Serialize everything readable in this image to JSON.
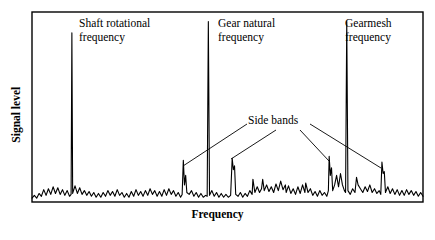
{
  "figure": {
    "type": "vibration-spectrum",
    "background": "#ffffff",
    "ink_color": "#000000"
  },
  "axes": {
    "x_label": "Frequency",
    "y_label": "Signal level",
    "frame": {
      "left": 32,
      "top": 12,
      "right": 423,
      "bottom": 202
    },
    "x_ticks": [],
    "y_ticks": [],
    "grid": false
  },
  "annotations": [
    {
      "id": "shaft-rotational-frequency",
      "text": "Shaft rotational\nfrequency",
      "x": 79,
      "y": 17
    },
    {
      "id": "gear-natural-frequency",
      "text": "Gear natural\nfrequency",
      "x": 218,
      "y": 17
    },
    {
      "id": "gearmesh-frequency",
      "text": "Gearmesh\nfrequency",
      "x": 345,
      "y": 17
    },
    {
      "id": "side-bands",
      "text": "Side bands",
      "x": 248,
      "y": 114
    }
  ],
  "leader_lines": [
    {
      "id": "sideband-leader-left",
      "x1": 247,
      "y1": 124,
      "x2": 183,
      "y2": 166
    },
    {
      "id": "sideband-leader-inner-left",
      "x1": 276,
      "y1": 130,
      "x2": 231,
      "y2": 159
    },
    {
      "id": "sideband-leader-inner-right",
      "x1": 300,
      "y1": 130,
      "x2": 329,
      "y2": 161
    },
    {
      "id": "sideband-leader-right",
      "x1": 310,
      "y1": 124,
      "x2": 381,
      "y2": 168
    }
  ],
  "chart_data": {
    "type": "line",
    "title": "",
    "xlabel": "Frequency",
    "ylabel": "Signal level",
    "xlim": [
      0,
      100
    ],
    "ylim": [
      0,
      100
    ],
    "grid": false,
    "legend": null,
    "series": [
      {
        "name": "vibration spectrum",
        "color": "#000000",
        "description": "Broadband noise floor with three dominant narrow peaks and sideband clusters",
        "peaks": [
          {
            "label": "Shaft rotational frequency",
            "x": 10.2,
            "height": 89
          },
          {
            "label": "Gear natural frequency",
            "x": 45.1,
            "height": 95
          },
          {
            "label": "Gearmesh frequency",
            "x": 80.5,
            "height": 95
          }
        ],
        "sidebands": [
          {
            "x": 38.7,
            "height": 22
          },
          {
            "x": 51.2,
            "height": 23
          },
          {
            "x": 56.5,
            "height": 12
          },
          {
            "x": 59.0,
            "height": 12
          },
          {
            "x": 65.0,
            "height": 5
          },
          {
            "x": 70.0,
            "height": 10
          },
          {
            "x": 76.0,
            "height": 24
          },
          {
            "x": 83.0,
            "height": 13
          },
          {
            "x": 89.5,
            "height": 21
          }
        ],
        "points": [
          [
            0.0,
            2.0
          ],
          [
            0.6,
            3.5
          ],
          [
            1.2,
            2.0
          ],
          [
            1.8,
            4.5
          ],
          [
            2.4,
            3.0
          ],
          [
            3.0,
            6.5
          ],
          [
            3.6,
            3.5
          ],
          [
            4.2,
            7.0
          ],
          [
            4.8,
            4.0
          ],
          [
            5.4,
            8.0
          ],
          [
            6.0,
            4.5
          ],
          [
            6.6,
            7.5
          ],
          [
            7.2,
            4.0
          ],
          [
            7.8,
            6.5
          ],
          [
            8.4,
            3.5
          ],
          [
            9.0,
            6.0
          ],
          [
            9.6,
            3.0
          ],
          [
            10.0,
            4.0
          ],
          [
            10.2,
            89.0
          ],
          [
            10.4,
            4.5
          ],
          [
            11.0,
            8.5
          ],
          [
            11.6,
            4.5
          ],
          [
            12.2,
            7.5
          ],
          [
            12.8,
            4.0
          ],
          [
            13.4,
            6.0
          ],
          [
            14.0,
            3.5
          ],
          [
            14.6,
            5.5
          ],
          [
            15.2,
            3.0
          ],
          [
            15.8,
            5.0
          ],
          [
            16.4,
            2.5
          ],
          [
            17.0,
            4.5
          ],
          [
            17.6,
            2.5
          ],
          [
            18.2,
            5.0
          ],
          [
            18.8,
            3.0
          ],
          [
            19.4,
            6.0
          ],
          [
            20.0,
            3.5
          ],
          [
            20.6,
            5.5
          ],
          [
            21.2,
            3.0
          ],
          [
            21.8,
            6.5
          ],
          [
            22.4,
            3.5
          ],
          [
            23.0,
            5.0
          ],
          [
            23.6,
            2.5
          ],
          [
            24.2,
            4.5
          ],
          [
            24.8,
            2.5
          ],
          [
            25.4,
            5.5
          ],
          [
            26.0,
            3.0
          ],
          [
            26.6,
            6.5
          ],
          [
            27.2,
            3.5
          ],
          [
            27.8,
            5.5
          ],
          [
            28.4,
            3.0
          ],
          [
            29.0,
            6.0
          ],
          [
            29.6,
            3.5
          ],
          [
            30.2,
            7.0
          ],
          [
            30.8,
            4.0
          ],
          [
            31.4,
            6.0
          ],
          [
            32.0,
            3.0
          ],
          [
            32.6,
            5.5
          ],
          [
            33.2,
            3.0
          ],
          [
            33.8,
            6.5
          ],
          [
            34.4,
            3.5
          ],
          [
            35.0,
            7.0
          ],
          [
            35.6,
            4.0
          ],
          [
            36.2,
            6.0
          ],
          [
            36.8,
            3.0
          ],
          [
            37.4,
            5.0
          ],
          [
            38.0,
            2.5
          ],
          [
            38.4,
            4.0
          ],
          [
            38.7,
            22.0
          ],
          [
            39.0,
            9.0
          ],
          [
            39.3,
            14.0
          ],
          [
            39.6,
            5.0
          ],
          [
            40.2,
            4.0
          ],
          [
            40.8,
            6.0
          ],
          [
            41.4,
            3.0
          ],
          [
            42.0,
            5.0
          ],
          [
            42.6,
            2.5
          ],
          [
            43.2,
            4.5
          ],
          [
            43.8,
            2.5
          ],
          [
            44.4,
            3.5
          ],
          [
            44.8,
            3.0
          ],
          [
            45.1,
            95.0
          ],
          [
            45.4,
            3.5
          ],
          [
            46.0,
            6.0
          ],
          [
            46.6,
            3.0
          ],
          [
            47.2,
            5.0
          ],
          [
            47.8,
            2.5
          ],
          [
            48.4,
            4.5
          ],
          [
            49.0,
            2.5
          ],
          [
            49.6,
            4.0
          ],
          [
            50.2,
            2.5
          ],
          [
            50.8,
            3.5
          ],
          [
            51.2,
            23.0
          ],
          [
            51.5,
            17.0
          ],
          [
            51.8,
            19.0
          ],
          [
            52.1,
            4.0
          ],
          [
            52.7,
            3.0
          ],
          [
            53.3,
            5.0
          ],
          [
            53.9,
            2.5
          ],
          [
            54.5,
            4.5
          ],
          [
            55.1,
            3.0
          ],
          [
            55.7,
            6.0
          ],
          [
            56.3,
            4.0
          ],
          [
            56.5,
            12.0
          ],
          [
            57.0,
            5.0
          ],
          [
            57.6,
            8.0
          ],
          [
            58.2,
            5.0
          ],
          [
            58.7,
            7.0
          ],
          [
            59.0,
            12.0
          ],
          [
            59.4,
            6.0
          ],
          [
            60.0,
            9.0
          ],
          [
            60.6,
            5.5
          ],
          [
            61.2,
            8.0
          ],
          [
            61.8,
            5.0
          ],
          [
            62.4,
            9.5
          ],
          [
            63.0,
            6.0
          ],
          [
            63.6,
            11.0
          ],
          [
            64.2,
            6.5
          ],
          [
            64.8,
            9.0
          ],
          [
            65.0,
            5.0
          ],
          [
            65.6,
            8.5
          ],
          [
            66.2,
            4.5
          ],
          [
            66.8,
            7.0
          ],
          [
            67.4,
            4.0
          ],
          [
            68.0,
            8.0
          ],
          [
            68.6,
            4.5
          ],
          [
            69.2,
            9.0
          ],
          [
            69.8,
            5.0
          ],
          [
            70.0,
            10.0
          ],
          [
            70.6,
            5.0
          ],
          [
            71.2,
            7.0
          ],
          [
            71.8,
            3.5
          ],
          [
            72.4,
            5.5
          ],
          [
            73.0,
            3.0
          ],
          [
            73.6,
            6.0
          ],
          [
            74.2,
            3.5
          ],
          [
            74.8,
            5.0
          ],
          [
            75.4,
            3.0
          ],
          [
            75.8,
            6.0
          ],
          [
            76.0,
            24.0
          ],
          [
            76.3,
            14.0
          ],
          [
            76.6,
            18.0
          ],
          [
            76.9,
            6.0
          ],
          [
            77.4,
            9.0
          ],
          [
            77.9,
            14.0
          ],
          [
            78.4,
            8.0
          ],
          [
            78.9,
            15.0
          ],
          [
            79.4,
            9.0
          ],
          [
            79.9,
            6.0
          ],
          [
            80.2,
            5.0
          ],
          [
            80.5,
            95.0
          ],
          [
            80.8,
            6.0
          ],
          [
            81.4,
            4.0
          ],
          [
            82.0,
            7.0
          ],
          [
            82.6,
            5.0
          ],
          [
            83.0,
            13.0
          ],
          [
            83.4,
            9.0
          ],
          [
            84.0,
            7.0
          ],
          [
            84.6,
            5.0
          ],
          [
            85.2,
            8.0
          ],
          [
            85.8,
            5.5
          ],
          [
            86.4,
            9.0
          ],
          [
            87.0,
            5.0
          ],
          [
            87.6,
            7.0
          ],
          [
            88.2,
            4.5
          ],
          [
            88.8,
            6.0
          ],
          [
            89.2,
            4.0
          ],
          [
            89.5,
            21.0
          ],
          [
            89.8,
            15.0
          ],
          [
            90.1,
            16.0
          ],
          [
            90.4,
            5.0
          ],
          [
            91.0,
            8.0
          ],
          [
            91.6,
            4.5
          ],
          [
            92.2,
            7.0
          ],
          [
            92.8,
            4.0
          ],
          [
            93.4,
            6.5
          ],
          [
            94.0,
            3.5
          ],
          [
            94.6,
            6.0
          ],
          [
            95.2,
            3.5
          ],
          [
            95.8,
            6.5
          ],
          [
            96.4,
            4.0
          ],
          [
            97.0,
            6.0
          ],
          [
            97.6,
            3.5
          ],
          [
            98.2,
            5.5
          ],
          [
            98.8,
            3.0
          ],
          [
            99.4,
            5.0
          ],
          [
            100.0,
            3.0
          ]
        ]
      }
    ]
  }
}
